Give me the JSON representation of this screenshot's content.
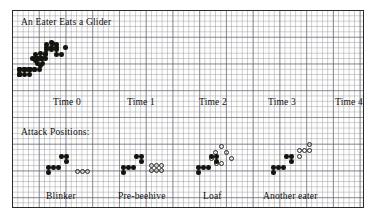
{
  "figure": {
    "title": "An Eater Eats a Glider",
    "section_label": "Attack Positions:",
    "cell_px": 5.35,
    "colors": {
      "ink": "#14140f",
      "grid": "#5a5a6e",
      "border": "#2b2b2b",
      "paper": "#fdfdfb"
    }
  },
  "top_row": {
    "captions": [
      "Time 0",
      "Time 1",
      "Time 2",
      "Time 3",
      "Time 4"
    ],
    "caption_x": [
      40,
      114,
      186,
      255,
      322
    ],
    "caption_y": 86,
    "frames": [
      {
        "label": "Time 0",
        "origin_x": 28,
        "origin_y": 28,
        "eater": [
          [
            3,
            3
          ],
          [
            3,
            4
          ],
          [
            4,
            3
          ],
          [
            5,
            2
          ],
          [
            5,
            1
          ],
          [
            4,
            1
          ],
          [
            3,
            1
          ]
        ],
        "glider": [
          [
            0,
            0
          ],
          [
            1,
            0
          ],
          [
            2,
            0
          ],
          [
            2,
            -1
          ],
          [
            1,
            -3
          ]
        ],
        "cells_filled": [
          [
            36,
            29
          ],
          [
            31,
            34
          ],
          [
            36,
            34
          ],
          [
            41,
            34
          ],
          [
            25,
            45
          ],
          [
            30,
            45
          ],
          [
            30,
            40
          ],
          [
            14,
            56
          ],
          [
            19,
            56
          ],
          [
            24,
            56
          ],
          [
            14,
            61
          ]
        ]
      },
      {
        "label": "Time 1",
        "origin_x": 103,
        "origin_y": 28,
        "cells_filled": [
          [
            31,
            31
          ],
          [
            31,
            36
          ],
          [
            36,
            36
          ],
          [
            41,
            31
          ],
          [
            41,
            36
          ],
          [
            20,
            45
          ],
          [
            25,
            45
          ],
          [
            25,
            40
          ],
          [
            30,
            41
          ],
          [
            4,
            56
          ],
          [
            9,
            56
          ],
          [
            14,
            56
          ],
          [
            4,
            61
          ]
        ]
      },
      {
        "label": "Time 2",
        "origin_x": 178,
        "origin_y": 28,
        "cells_filled": [
          [
            37,
            30
          ],
          [
            46,
            41
          ],
          [
            41,
            41
          ],
          [
            20,
            41
          ],
          [
            20,
            47
          ],
          [
            25,
            52
          ],
          [
            4,
            56
          ],
          [
            9,
            56
          ],
          [
            14,
            56
          ],
          [
            4,
            61
          ]
        ]
      },
      {
        "label": "Time 3",
        "origin_x": 248,
        "origin_y": 28,
        "cells_filled": [
          [
            50,
            34
          ],
          [
            17,
            45
          ],
          [
            22,
            45
          ],
          [
            22,
            50
          ],
          [
            4,
            56
          ],
          [
            9,
            56
          ],
          [
            14,
            56
          ],
          [
            4,
            61
          ]
        ]
      },
      {
        "label": "Time 4",
        "origin_x": 318,
        "origin_y": 28,
        "cells_filled": [
          [
            22,
            45
          ],
          [
            27,
            45
          ],
          [
            27,
            50
          ],
          [
            9,
            56
          ],
          [
            14,
            56
          ],
          [
            19,
            56
          ],
          [
            9,
            61
          ]
        ]
      }
    ]
  },
  "bottom_row": {
    "captions": [
      "Blinker",
      "Pre-beehive",
      "Loaf",
      "Another eater"
    ],
    "caption_x": [
      33,
      105,
      190,
      250
    ],
    "caption_y": 180,
    "frames": [
      {
        "label": "Blinker",
        "attack_open": [
          [
            62,
            158
          ],
          [
            67,
            158
          ],
          [
            72,
            158
          ]
        ],
        "eater_filled": [
          [
            46,
            143
          ],
          [
            51,
            143
          ],
          [
            51,
            148
          ],
          [
            33,
            154
          ],
          [
            38,
            154
          ],
          [
            43,
            154
          ],
          [
            33,
            159
          ]
        ]
      },
      {
        "label": "Pre-beehive",
        "attack_open": [
          [
            136,
            152
          ],
          [
            141,
            152
          ],
          [
            146,
            152
          ],
          [
            136,
            157
          ],
          [
            141,
            157
          ],
          [
            146,
            157
          ]
        ],
        "eater_filled": [
          [
            121,
            143
          ],
          [
            126,
            143
          ],
          [
            126,
            148
          ],
          [
            108,
            154
          ],
          [
            113,
            154
          ],
          [
            118,
            154
          ],
          [
            108,
            159
          ]
        ]
      },
      {
        "label": "Loaf",
        "attack_open": [
          [
            206,
            133
          ],
          [
            200,
            139
          ],
          [
            211,
            139
          ],
          [
            196,
            145
          ],
          [
            216,
            145
          ],
          [
            201,
            150
          ],
          [
            206,
            150
          ]
        ],
        "eater_filled": [
          [
            196,
            143
          ],
          [
            201,
            143
          ],
          [
            201,
            148
          ],
          [
            183,
            154
          ],
          [
            188,
            154
          ],
          [
            193,
            154
          ],
          [
            183,
            159
          ]
        ]
      },
      {
        "label": "Another eater",
        "attack_open": [
          [
            294,
            131
          ],
          [
            284,
            137
          ],
          [
            289,
            137
          ],
          [
            294,
            137
          ],
          [
            284,
            143
          ]
        ],
        "eater_filled": [
          [
            271,
            143
          ],
          [
            276,
            143
          ],
          [
            276,
            148
          ],
          [
            258,
            154
          ],
          [
            263,
            154
          ],
          [
            268,
            154
          ],
          [
            258,
            159
          ]
        ]
      }
    ]
  }
}
